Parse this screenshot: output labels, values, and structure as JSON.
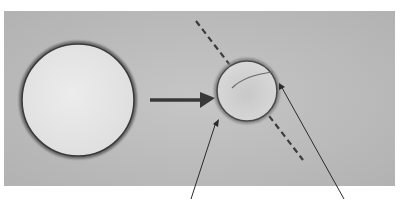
{
  "figure": {
    "colors": {
      "page": "#ffffff",
      "panel": "#b9b9b9",
      "panel_light": "#c8c8c8",
      "large_cell_fill": "#e6e6e6",
      "small_cell_fill": "#d4d4d4",
      "outline": "#3a3a3a",
      "arrow": "#383838",
      "dashed_line": "#3c3c3c",
      "pointer_lines": "#2a2a2a"
    },
    "labels": []
  }
}
